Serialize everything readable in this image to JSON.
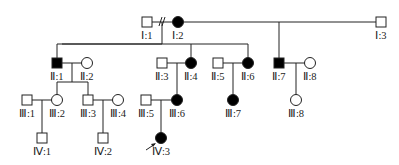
{
  "diagram": {
    "type": "pedigree",
    "colors": {
      "affected": "#000000",
      "unaffected": "#ffffff",
      "stroke": "#222222",
      "background": "#ffffff"
    },
    "generations": [
      "I",
      "II",
      "III",
      "IV"
    ],
    "individuals": [
      {
        "id": "I:1",
        "label": "Ⅰ:1",
        "sex": "male",
        "affected": false,
        "x": 147,
        "y": 22
      },
      {
        "id": "I:2",
        "label": "Ⅰ:2",
        "sex": "female",
        "affected": true,
        "x": 178,
        "y": 22
      },
      {
        "id": "I:3",
        "label": "Ⅰ:3",
        "sex": "male",
        "affected": false,
        "x": 381,
        "y": 22
      },
      {
        "id": "II:1",
        "label": "Ⅱ:1",
        "sex": "male",
        "affected": true,
        "x": 57,
        "y": 63
      },
      {
        "id": "II:2",
        "label": "Ⅱ:2",
        "sex": "female",
        "affected": false,
        "x": 87,
        "y": 63
      },
      {
        "id": "II:3",
        "label": "Ⅱ:3",
        "sex": "male",
        "affected": false,
        "x": 162,
        "y": 63
      },
      {
        "id": "II:4",
        "label": "Ⅱ:4",
        "sex": "female",
        "affected": true,
        "x": 191,
        "y": 63
      },
      {
        "id": "II:5",
        "label": "Ⅱ:5",
        "sex": "male",
        "affected": false,
        "x": 218,
        "y": 63
      },
      {
        "id": "II:6",
        "label": "Ⅱ:6",
        "sex": "female",
        "affected": true,
        "x": 248,
        "y": 63
      },
      {
        "id": "II:7",
        "label": "Ⅱ:7",
        "sex": "male",
        "affected": true,
        "x": 279,
        "y": 63
      },
      {
        "id": "II:8",
        "label": "Ⅱ:8",
        "sex": "female",
        "affected": false,
        "x": 310,
        "y": 63
      },
      {
        "id": "III:1",
        "label": "Ⅲ:1",
        "sex": "male",
        "affected": false,
        "x": 27,
        "y": 100
      },
      {
        "id": "III:2",
        "label": "Ⅲ:2",
        "sex": "female",
        "affected": false,
        "x": 57,
        "y": 100
      },
      {
        "id": "III:3",
        "label": "Ⅲ:3",
        "sex": "male",
        "affected": false,
        "x": 88,
        "y": 100
      },
      {
        "id": "III:4",
        "label": "Ⅲ:4",
        "sex": "female",
        "affected": false,
        "x": 118,
        "y": 100
      },
      {
        "id": "III:5",
        "label": "Ⅲ:5",
        "sex": "male",
        "affected": false,
        "x": 146,
        "y": 100
      },
      {
        "id": "III:6",
        "label": "Ⅲ:6",
        "sex": "female",
        "affected": true,
        "x": 177,
        "y": 100
      },
      {
        "id": "III:7",
        "label": "Ⅲ:7",
        "sex": "female",
        "affected": true,
        "x": 233,
        "y": 100
      },
      {
        "id": "III:8",
        "label": "Ⅲ:8",
        "sex": "female",
        "affected": false,
        "x": 296,
        "y": 100
      },
      {
        "id": "IV:1",
        "label": "Ⅳ:1",
        "sex": "male",
        "affected": false,
        "x": 42,
        "y": 138
      },
      {
        "id": "IV:2",
        "label": "Ⅳ:2",
        "sex": "male",
        "affected": false,
        "x": 103,
        "y": 138
      },
      {
        "id": "IV:3",
        "label": "Ⅳ:3",
        "sex": "female",
        "affected": true,
        "x": 161,
        "y": 138,
        "proband": true
      }
    ],
    "unions": [
      {
        "partners": [
          "I:1",
          "I:2"
        ],
        "divorced": true
      },
      {
        "partners": [
          "I:2",
          "I:3"
        ]
      },
      {
        "partners": [
          "II:1",
          "II:2"
        ]
      },
      {
        "partners": [
          "II:3",
          "II:4"
        ]
      },
      {
        "partners": [
          "II:5",
          "II:6"
        ]
      },
      {
        "partners": [
          "II:7",
          "II:8"
        ]
      },
      {
        "partners": [
          "III:1",
          "III:2"
        ]
      },
      {
        "partners": [
          "III:3",
          "III:4"
        ]
      },
      {
        "partners": [
          "III:5",
          "III:6"
        ]
      }
    ],
    "proband_marker": "arrow-icon"
  }
}
